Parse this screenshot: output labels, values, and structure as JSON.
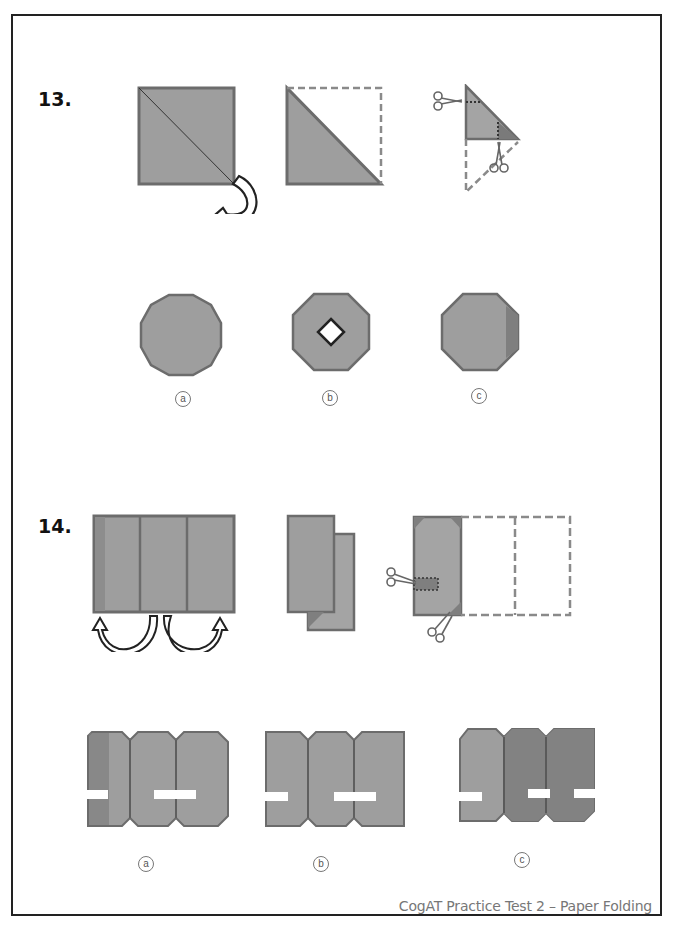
{
  "colors": {
    "paper_fill": "#9e9e9e",
    "paper_fill_dark": "#7f7f7f",
    "paper_stroke": "#6c6c6c",
    "dash_stroke": "#8a8a8a",
    "frame": "#222222",
    "footer_text": "#777777"
  },
  "questions": [
    {
      "number": "13.",
      "steps": [
        {
          "name": "square-with-diagonal-fold",
          "icon": "curved-fold-arrow-icon"
        },
        {
          "name": "folded-triangle-with-dashed-outline"
        },
        {
          "name": "triangle-with-cut-marks",
          "icon": "scissors-icon"
        }
      ],
      "options": [
        {
          "label": "a",
          "shape": "dodecagon"
        },
        {
          "label": "b",
          "shape": "octagon-with-diamond-hole"
        },
        {
          "label": "c",
          "shape": "octagon-with-shaded-edge"
        }
      ]
    },
    {
      "number": "14.",
      "steps": [
        {
          "name": "three-panel-sheet",
          "icon": "fold-arrows-icon"
        },
        {
          "name": "accordion-folded-sheet"
        },
        {
          "name": "folded-panel-with-cut-marks",
          "icon": "scissors-icon"
        }
      ],
      "options": [
        {
          "label": "a",
          "shape": "three-panels-slot-left-and-middle"
        },
        {
          "label": "b",
          "shape": "three-panels-slot-left-and-middle"
        },
        {
          "label": "c",
          "shape": "three-panels-slot-left-middle-right"
        }
      ]
    }
  ],
  "footer": {
    "text": "CogAT Practice Test 2 – Paper Folding"
  }
}
